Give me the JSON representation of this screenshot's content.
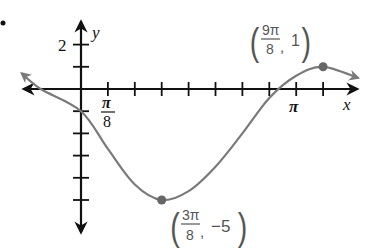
{
  "chart_data": {
    "type": "line",
    "title": "",
    "xlabel": "x",
    "ylabel": "y",
    "x_unit": "pi/8",
    "xlim_units": [
      -2.2,
      10.3
    ],
    "ylim": [
      -6.8,
      2.8
    ],
    "x_ticks_units": [
      1,
      2,
      3,
      4,
      5,
      6,
      7,
      8,
      9
    ],
    "x_tick_labels": [
      {
        "at": 1,
        "numerator": "π",
        "denominator": "8"
      },
      {
        "at": 8,
        "text": "π"
      }
    ],
    "y_ticks": [
      2,
      1,
      -1,
      -2,
      -3,
      -4,
      -5
    ],
    "y_tick_labels": [
      {
        "at": 2,
        "text": "2"
      }
    ],
    "grid": false,
    "series": [
      {
        "name": "sinusoid",
        "color": "#7a7a7a",
        "points_units": [
          [
            -2.2,
            0.7
          ],
          [
            -1.5,
            0.0
          ],
          [
            0,
            -1.0
          ],
          [
            1,
            -2.7
          ],
          [
            2,
            -4.3
          ],
          [
            3,
            -5.0
          ],
          [
            4,
            -4.6
          ],
          [
            5,
            -3.5
          ],
          [
            6,
            -2.0
          ],
          [
            7,
            -0.4
          ],
          [
            8,
            0.6
          ],
          [
            9,
            1.0
          ],
          [
            10.3,
            0.5
          ]
        ],
        "arrows": [
          "start",
          "end"
        ]
      }
    ],
    "annotations": [
      {
        "point_units": [
          3,
          -5
        ],
        "label": {
          "num": "3π",
          "den": "8",
          "y": "−5"
        },
        "marked": true
      },
      {
        "point_units": [
          9,
          1
        ],
        "label": {
          "num": "9π",
          "den": "8",
          "y": "1"
        },
        "marked": true
      }
    ]
  },
  "labels": {
    "y_axis": "y",
    "x_axis": "x",
    "y_two": "2",
    "pi_over_8_num": "π",
    "pi_over_8_den": "8",
    "pi": "π",
    "max_num": "9π",
    "max_den": "8",
    "max_y": "1",
    "min_num": "3π",
    "min_den": "8",
    "min_y": "−5",
    "comma": ","
  }
}
